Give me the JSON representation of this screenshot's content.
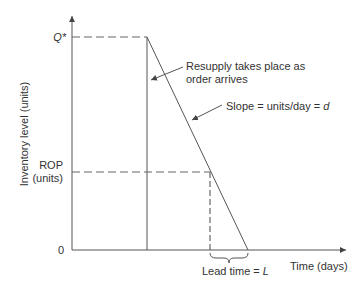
{
  "diagram": {
    "y_axis_label": "Inventory level (units)",
    "x_axis_label": "Time (days)",
    "y_ticks": {
      "q_star": "Q*",
      "rop_line1": "ROP",
      "rop_line2": "(units)",
      "zero": "0"
    },
    "annotations": {
      "resupply_line1": "Resupply takes place as",
      "resupply_line2": "order arrives",
      "slope_prefix": "Slope = units/day = ",
      "slope_var": "d",
      "lead_prefix": "Lead time = ",
      "lead_var": "L"
    },
    "colors": {
      "line": "#555555",
      "dash": "#666666",
      "text": "#333333"
    }
  }
}
